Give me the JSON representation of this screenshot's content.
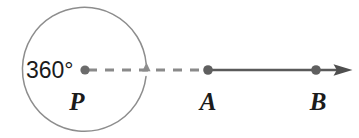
{
  "figure": {
    "background_color": "#ffffff",
    "stroke_color": "#6e6e6e",
    "solid_ray_color": "#5a5a5a",
    "text_color": "#1b1b1b",
    "angle_measure": "360°",
    "labels": {
      "center": "P",
      "point_a": "A",
      "point_b": "B"
    },
    "points": [
      {
        "name": "P",
        "label": "P",
        "x": 85,
        "y": 70
      },
      {
        "name": "A",
        "label": "A",
        "x": 208,
        "y": 70
      },
      {
        "name": "B",
        "label": "B",
        "x": 316,
        "y": 70
      }
    ],
    "circle": {
      "center_x": 85,
      "center_y": 70,
      "radius": 62,
      "rotation_direction": "counterclockwise"
    },
    "dashed_segment": {
      "from": "P",
      "to": "A",
      "style": "dashed"
    },
    "solid_ray": {
      "from": "A",
      "through": "B",
      "style": "solid-with-arrowhead"
    }
  }
}
